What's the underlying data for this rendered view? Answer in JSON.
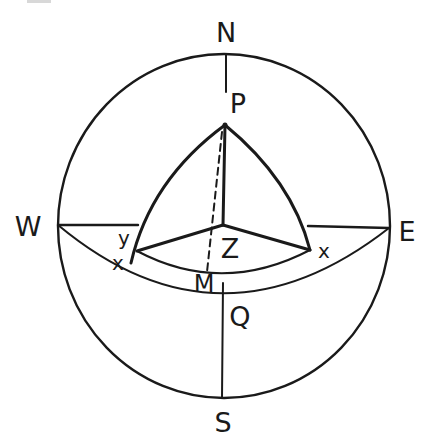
{
  "diagram": {
    "title": "",
    "type": "celestial-sphere-projection",
    "labels": {
      "north": "N",
      "south": "S",
      "west": "W",
      "east": "E",
      "pole": "P",
      "zenith": "Z",
      "meridian_point": "M",
      "equator_point": "Q",
      "star_left": "x",
      "star_right": "x",
      "arc_y": "y"
    },
    "elements": [
      {
        "name": "horizon-circle",
        "kind": "circle",
        "center": [
          224,
          226
        ],
        "radius": 171
      },
      {
        "name": "meridian-line-north",
        "kind": "line",
        "from": [
          226,
          53
        ],
        "to": [
          226,
          92
        ]
      },
      {
        "name": "meridian-line-south",
        "kind": "line",
        "from": [
          223,
          285
        ],
        "to": [
          222,
          398
        ]
      },
      {
        "name": "prime-vertical-west",
        "kind": "line",
        "from": [
          58,
          225
        ],
        "to": [
          138,
          225
        ]
      },
      {
        "name": "prime-vertical-east",
        "kind": "line",
        "from": [
          308,
          226
        ],
        "to": [
          389,
          228
        ]
      },
      {
        "name": "celestial-equator",
        "kind": "arc",
        "from": [
          58,
          225
        ],
        "via": [
          222,
          296
        ],
        "to": [
          389,
          228
        ]
      },
      {
        "name": "declination-circle",
        "kind": "arc",
        "from": [
          137,
          251
        ],
        "via": [
          222,
          273
        ],
        "to": [
          310,
          250
        ]
      },
      {
        "name": "hour-circle-left",
        "kind": "arc",
        "from": [
          225,
          125
        ],
        "to": [
          131,
          263
        ]
      },
      {
        "name": "hour-circle-right",
        "kind": "arc",
        "from": [
          225,
          125
        ],
        "to": [
          310,
          250
        ]
      },
      {
        "name": "pole-zenith-line",
        "kind": "line",
        "from": [
          225,
          125
        ],
        "to": [
          223,
          225
        ]
      },
      {
        "name": "zenith-to-left-star",
        "kind": "line",
        "from": [
          223,
          225
        ],
        "to": [
          137,
          251
        ]
      },
      {
        "name": "zenith-to-right-star",
        "kind": "line",
        "from": [
          223,
          225
        ],
        "to": [
          310,
          250
        ]
      },
      {
        "name": "pole-to-M-dashed",
        "kind": "dashed-line",
        "from": [
          222,
          130
        ],
        "to": [
          207,
          272
        ]
      }
    ]
  }
}
